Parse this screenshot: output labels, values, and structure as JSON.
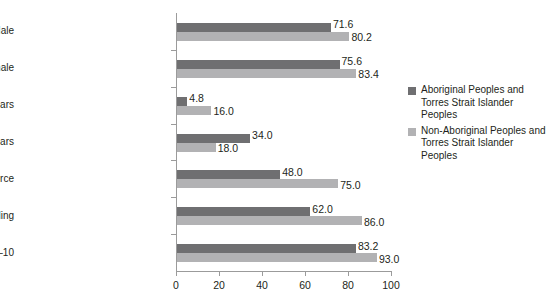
{
  "chart_data": {
    "type": "bar",
    "orientation": "horizontal",
    "title": "",
    "xlabel": "",
    "ylabel": "",
    "xlim": [
      0,
      100
    ],
    "xticks": [
      0,
      20,
      40,
      60,
      80,
      100
    ],
    "xtick_labels": [
      "0",
      "20",
      "40",
      "60",
      "80",
      "100"
    ],
    "grid": false,
    "legend_position": "right",
    "colors": {
      "series_0": "#6f6f71",
      "series_1": "#b2b2b4",
      "axis": "#9b9b9b",
      "text": "#231f20",
      "background": "#ffffff"
    },
    "categories": [
      "Life expectancy (years) – Male",
      "Life expectancy (years) – Female",
      "% aged 65+ years",
      "% aged under 15 years",
      "% aged 15–64 years in workforce",
      "% finishing Year 12 schooling",
      "% school attendance Years 1–10"
    ],
    "series": [
      {
        "name": "Aboriginal Peoples and Torres Strait Islander Peoples",
        "color": "#6f6f71",
        "values": [
          71.6,
          75.6,
          4.8,
          34.0,
          48.0,
          62.0,
          83.2
        ],
        "labels": [
          "71.6",
          "75.6",
          "4.8",
          "34.0",
          "48.0",
          "62.0",
          "83.2"
        ]
      },
      {
        "name": "Non-Aboriginal Peoples and Torres Strait Islander Peoples",
        "color": "#b2b2b4",
        "values": [
          80.2,
          83.4,
          16.0,
          18.0,
          75.0,
          86.0,
          93.0
        ],
        "labels": [
          "80.2",
          "83.4",
          "16.0",
          "18.0",
          "75.0",
          "86.0",
          "93.0"
        ]
      }
    ]
  },
  "legend": {
    "items": [
      {
        "line1": "Aboriginal Peoples and",
        "line2": "Torres Strait Islander",
        "line3": "Peoples",
        "swatch": "#6f6f71"
      },
      {
        "line1": "Non-Aboriginal Peoples and",
        "line2": "Torres Strait Islander",
        "line3": "Peoples",
        "swatch": "#b2b2b4"
      }
    ]
  }
}
